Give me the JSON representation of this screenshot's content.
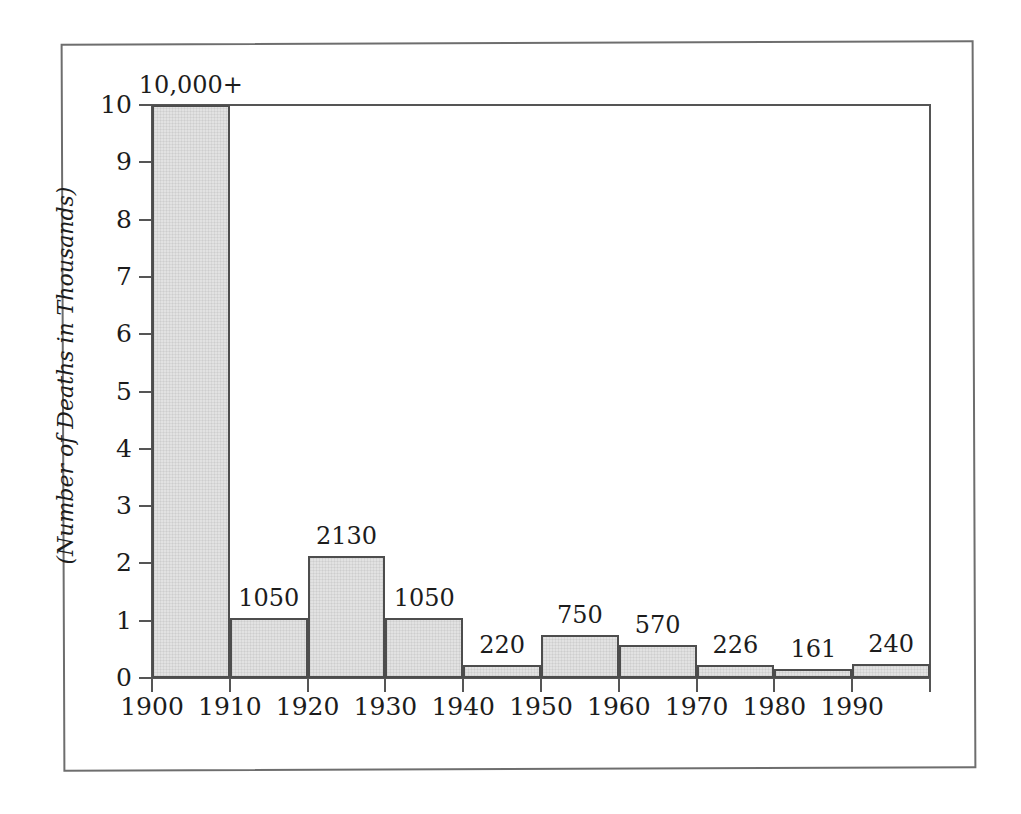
{
  "figure": {
    "frame_visible": true,
    "background_color": "#ffffff",
    "bar_fill_color": "#e2e2e2",
    "bar_border_color": "#4d4d4d",
    "axis_color": "#555555",
    "text_color": "#1c1c1c"
  },
  "chart_data": {
    "type": "bar",
    "title": "",
    "subtitle": "",
    "xlabel": "",
    "ylabel": "(Number of Deaths in Thousands)",
    "categories": [
      "1900",
      "1910",
      "1920",
      "1930",
      "1940",
      "1950",
      "1960",
      "1970",
      "1980",
      "1990"
    ],
    "values": [
      10,
      1.05,
      2.13,
      1.05,
      0.22,
      0.75,
      0.57,
      0.226,
      0.161,
      0.24
    ],
    "data_labels": [
      "10,000+",
      "1050",
      "2130",
      "1050",
      "220",
      "750",
      "570",
      "226",
      "161",
      "240"
    ],
    "x_tick_labels": [
      "1900",
      "1910",
      "1920",
      "1930",
      "1940",
      "1950",
      "1960",
      "1970",
      "1980",
      "1990",
      ""
    ],
    "y_tick_labels": [
      "0",
      "1",
      "2",
      "3",
      "4",
      "5",
      "6",
      "7",
      "8",
      "9",
      "10"
    ],
    "y_tick_values": [
      0,
      1,
      2,
      3,
      4,
      5,
      6,
      7,
      8,
      9,
      10
    ],
    "ylim": [
      0,
      10
    ],
    "xlim": [
      1900,
      2000
    ],
    "grid": false,
    "legend": false,
    "legend_position": "none",
    "bar_style": "contiguous-histogram",
    "annotations": [
      "First bar is truncated at the axis maximum of 10 and labeled 10,000+"
    ]
  }
}
